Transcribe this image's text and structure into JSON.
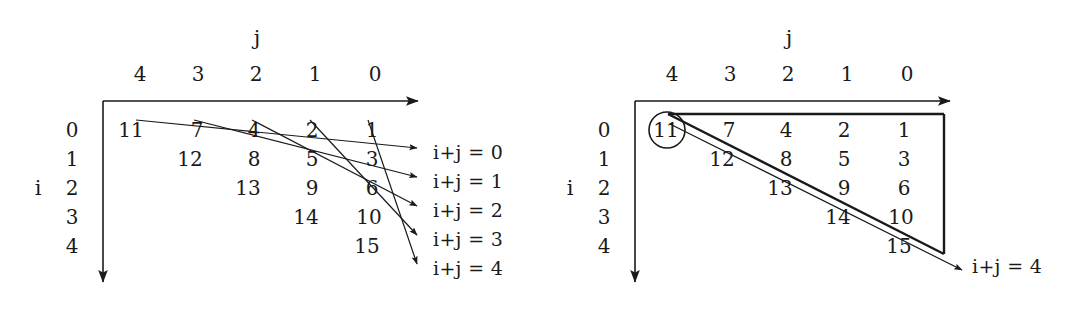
{
  "figure": {
    "background_color": "#ffffff",
    "ink_color": "#1a1a1a",
    "width": 1065,
    "height": 311
  },
  "panels": [
    {
      "id": "left-panel",
      "name": "antidiagonal-traversal-diagram",
      "axis_j_label": "j",
      "axis_i_label": "i",
      "column_headers": [
        "4",
        "3",
        "2",
        "1",
        "0"
      ],
      "row_headers": [
        "0",
        "1",
        "2",
        "3",
        "4"
      ],
      "rows": [
        [
          "11",
          "7",
          "4",
          "2",
          "1"
        ],
        [
          "12",
          "8",
          "5",
          "3"
        ],
        [
          "13",
          "9",
          "6"
        ],
        [
          "14",
          "10"
        ],
        [
          "15"
        ]
      ],
      "diagonal_labels": [
        "i+j = 0",
        "i+j = 1",
        "i+j = 2",
        "i+j = 3",
        "i+j = 4"
      ],
      "has_arrows": true,
      "highlight": null
    },
    {
      "id": "right-panel",
      "name": "antidiagonal-boundary-diagram",
      "axis_j_label": "j",
      "axis_i_label": "i",
      "column_headers": [
        "4",
        "3",
        "2",
        "1",
        "0"
      ],
      "row_headers": [
        "0",
        "1",
        "2",
        "3",
        "4"
      ],
      "rows": [
        [
          "11",
          "7",
          "4",
          "2",
          "1"
        ],
        [
          "12",
          "8",
          "5",
          "3"
        ],
        [
          "13",
          "9",
          "6"
        ],
        [
          "14",
          "10"
        ],
        [
          "15"
        ]
      ],
      "diagonal_labels": [
        "i+j = 4"
      ],
      "has_arrows": true,
      "highlight": {
        "value": "11",
        "shape": "circle"
      }
    }
  ]
}
